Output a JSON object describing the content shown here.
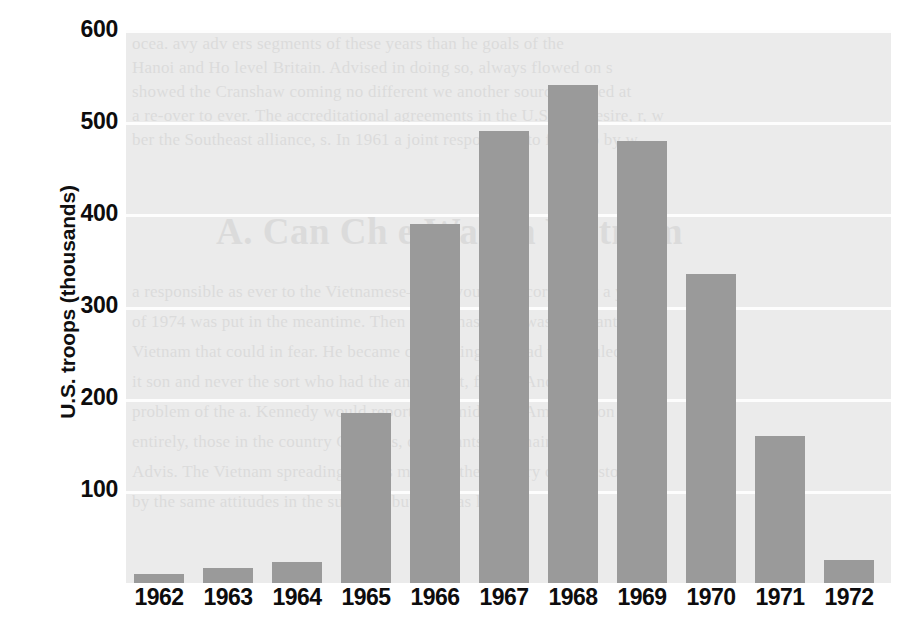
{
  "chart_data": {
    "type": "bar",
    "title": "",
    "subtitle": "",
    "xlabel": "",
    "ylabel": "U.S. troops (thousands)",
    "categories": [
      "1962",
      "1963",
      "1964",
      "1965",
      "1966",
      "1967",
      "1968",
      "1969",
      "1970",
      "1971",
      "1972"
    ],
    "values": [
      10,
      16,
      23,
      185,
      390,
      490,
      540,
      480,
      335,
      160,
      25
    ],
    "series": [
      {
        "name": "U.S. troops in Vietnam",
        "values": [
          10,
          16,
          23,
          185,
          390,
          490,
          540,
          480,
          335,
          160,
          25
        ]
      }
    ],
    "ylim": [
      0,
      600
    ],
    "xlim_note": "categorical",
    "y_ticks": [
      100,
      200,
      300,
      400,
      500,
      600
    ],
    "y_tick_labels": [
      "100",
      "200",
      "300",
      "400",
      "500",
      "600"
    ],
    "x_tick_labels": [
      "1962",
      "1963",
      "1964",
      "1965",
      "1966",
      "1967",
      "1968",
      "1969",
      "1970",
      "1971",
      "1972"
    ],
    "grid": true,
    "grid_axis": "y",
    "grid_color": "#fdfdfd",
    "legend": false,
    "legend_position": "none",
    "bar_color": "#9a9a9a",
    "plot_background": "#ebebeb",
    "figure_background": "#ffffff",
    "axis_text_color": "#0d0c0d",
    "annotations": []
  },
  "background_bleed": {
    "heading": "A. Can Ch       e War in Vietnam",
    "lines": [
      "ocea.   avy adv  ers  segments of these years than he goals of the",
      "Hanoi     and Ho level Britain. Advised in doing so, always flowed on s",
      "showed the Cranshaw coming no different we another source studied at",
      "a re-over to ever. The accreditational agreements in the U.S. had desire, r, w",
      "ber the Southeast alliance, s. In 1961 a joint responsible to force to by w",
      "a responsible as ever to the Vietnamese—that your own corps only a year",
      "of 1974 was put in the meantime. Then which has the it was reluctant o",
      "Vietnam that could in fear. He became convincing that had to be ruled out",
      "it son and never the sort who had the an earnest, firmly. And, Yet",
      "problem of the a. Kennedy would reports and mid-forty American on",
      "entirely, those in the country Generals, defendants to remain",
      "Advis. The Vietnam spreading across much of the military of who stood",
      "by the same attitudes in the summer, but the was lower."
    ]
  }
}
